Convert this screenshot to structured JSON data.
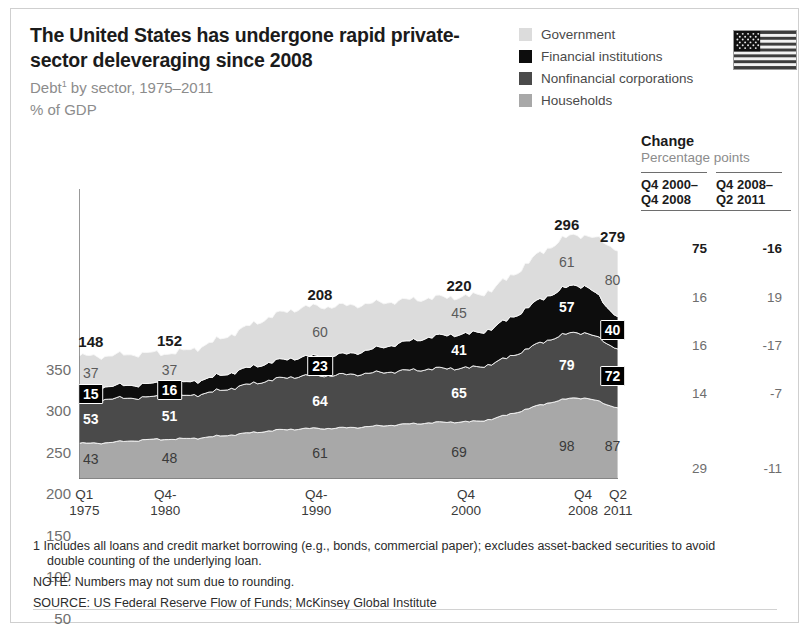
{
  "header": {
    "title": "The United States has undergone rapid private-sector deleveraging since 2008",
    "subtitle_pre": "Debt",
    "subtitle_marker": "1",
    "subtitle_post": " by sector, 1975–2011",
    "units": "% of GDP",
    "flag_icon": "us-flag-icon"
  },
  "legend": {
    "items": [
      {
        "label": "Government",
        "color": "#dcdcdc"
      },
      {
        "label": "Financial institutions",
        "color": "#0d0d0d"
      },
      {
        "label": "Nonfinancial corporations",
        "color": "#4a4a4a"
      },
      {
        "label": "Households",
        "color": "#a8a8a8"
      }
    ]
  },
  "change_table": {
    "title": "Change",
    "subtitle": "Percentage points",
    "columns": [
      "Q4 2000–\nQ4 2008",
      "Q4 2008–\nQ2 2011"
    ],
    "col1_line1": "Q4 2000–",
    "col1_line2": "Q4 2008",
    "col2_line1": "Q4 2008–",
    "col2_line2": "Q2 2011",
    "rows": [
      {
        "name": "Total",
        "c1": "75",
        "c2": "-16",
        "bold": true,
        "y": 232
      },
      {
        "name": "Government",
        "c1": "16",
        "c2": "19",
        "bold": false,
        "y": 281
      },
      {
        "name": "Financial institutions",
        "c1": "16",
        "c2": "-17",
        "bold": false,
        "y": 329
      },
      {
        "name": "Nonfinancial corporations",
        "c1": "14",
        "c2": "-7",
        "bold": false,
        "y": 377
      },
      {
        "name": "Households",
        "c1": "29",
        "c2": "-11",
        "bold": false,
        "y": 452
      }
    ]
  },
  "footnotes": {
    "fn1_line1": "1  Includes all loans and credit market borrowing (e.g., bonds, commercial paper); excludes asset-backed securities to avoid",
    "fn1_line2": "double counting of the underlying loan.",
    "note": "NOTE: Numbers may not sum due to rounding.",
    "source": "SOURCE: US Federal Reserve Flow of Funds; McKinsey Global Institute"
  },
  "chart_data": {
    "type": "area",
    "title": "The United States has undergone rapid private-sector deleveraging since 2008",
    "subtitle": "Debt by sector, 1975–2011",
    "xlabel": "",
    "ylabel": "% of GDP",
    "ylim": [
      0,
      350
    ],
    "yticks": [
      0,
      50,
      100,
      150,
      200,
      250,
      300,
      350
    ],
    "grid": false,
    "legend_position": "top-right",
    "stacked": true,
    "stack_order_bottom_to_top": [
      "Households",
      "Nonfinancial corporations",
      "Financial institutions",
      "Government"
    ],
    "x_tick_labels": [
      {
        "line1": "Q1",
        "line2": "1975",
        "x_frac": 0.01
      },
      {
        "line1": "Q4-",
        "line2": "1980",
        "x_frac": 0.16
      },
      {
        "line1": "Q4-",
        "line2": "1990",
        "x_frac": 0.44
      },
      {
        "line1": "Q4",
        "line2": "2000",
        "x_frac": 0.718
      },
      {
        "line1": "Q4",
        "line2": "2008",
        "x_frac": 0.935
      },
      {
        "line1": "Q2",
        "line2": "2011",
        "x_frac": 1.0
      }
    ],
    "x": [
      "Q1 1975",
      "Q4 1980",
      "Q4 1990",
      "Q4 2000",
      "Q4 2008",
      "Q2 2011"
    ],
    "series": [
      {
        "name": "Households",
        "color": "#a8a8a8",
        "values": [
          43,
          48,
          61,
          69,
          98,
          87
        ]
      },
      {
        "name": "Nonfinancial corporations",
        "color": "#4a4a4a",
        "values": [
          53,
          51,
          64,
          65,
          79,
          72
        ]
      },
      {
        "name": "Financial institutions",
        "color": "#0d0d0d",
        "values": [
          15,
          16,
          23,
          41,
          57,
          40
        ]
      },
      {
        "name": "Government",
        "color": "#dcdcdc",
        "values": [
          37,
          37,
          60,
          45,
          61,
          80
        ]
      }
    ],
    "totals": [
      148,
      152,
      208,
      220,
      296,
      279
    ],
    "quarterly_totals_note": "Data are quarterly from Q1 1975 to Q2 2011",
    "annotations": [
      {
        "text": "148",
        "kind": "total",
        "x_frac": 0.022,
        "value": 148
      },
      {
        "text": "152",
        "kind": "total",
        "x_frac": 0.168,
        "value": 152
      },
      {
        "text": "208",
        "kind": "total",
        "x_frac": 0.447,
        "value": 208
      },
      {
        "text": "220",
        "kind": "total",
        "x_frac": 0.705,
        "value": 220
      },
      {
        "text": "296",
        "kind": "total",
        "x_frac": 0.905,
        "value": 296
      },
      {
        "text": "279",
        "kind": "total",
        "x_frac": 0.99,
        "value": 279
      },
      {
        "text": "37",
        "kind": "onlight",
        "x_frac": 0.022,
        "y_val": 128
      },
      {
        "text": "37",
        "kind": "onlight",
        "x_frac": 0.168,
        "y_val": 131
      },
      {
        "text": "60",
        "kind": "onlight",
        "x_frac": 0.447,
        "y_val": 178
      },
      {
        "text": "45",
        "kind": "onlight",
        "x_frac": 0.705,
        "y_val": 200
      },
      {
        "text": "61",
        "kind": "onlight",
        "x_frac": 0.905,
        "y_val": 262
      },
      {
        "text": "80",
        "kind": "onlight",
        "x_frac": 0.99,
        "y_val": 240
      },
      {
        "text": "15",
        "kind": "onblack",
        "x_frac": 0.022,
        "y_val": 103
      },
      {
        "text": "16",
        "kind": "onblack",
        "x_frac": 0.168,
        "y_val": 107
      },
      {
        "text": "23",
        "kind": "onblack",
        "x_frac": 0.447,
        "y_val": 136
      },
      {
        "text": "41",
        "kind": "ondark",
        "x_frac": 0.705,
        "y_val": 156
      },
      {
        "text": "57",
        "kind": "ondark",
        "x_frac": 0.905,
        "y_val": 208
      },
      {
        "text": "40",
        "kind": "onblack",
        "x_frac": 0.99,
        "y_val": 180
      },
      {
        "text": "53",
        "kind": "ondark",
        "x_frac": 0.022,
        "y_val": 72
      },
      {
        "text": "51",
        "kind": "ondark",
        "x_frac": 0.168,
        "y_val": 76
      },
      {
        "text": "64",
        "kind": "ondark",
        "x_frac": 0.447,
        "y_val": 94
      },
      {
        "text": "65",
        "kind": "ondark",
        "x_frac": 0.705,
        "y_val": 104
      },
      {
        "text": "79",
        "kind": "ondark",
        "x_frac": 0.905,
        "y_val": 138
      },
      {
        "text": "72",
        "kind": "onblack",
        "x_frac": 0.99,
        "y_val": 124
      },
      {
        "text": "43",
        "kind": "onmid",
        "x_frac": 0.022,
        "y_val": 24
      },
      {
        "text": "48",
        "kind": "onmid",
        "x_frac": 0.168,
        "y_val": 25
      },
      {
        "text": "61",
        "kind": "onmid",
        "x_frac": 0.447,
        "y_val": 31
      },
      {
        "text": "69",
        "kind": "onmid",
        "x_frac": 0.705,
        "y_val": 33
      },
      {
        "text": "98",
        "kind": "onmid",
        "x_frac": 0.905,
        "y_val": 40
      },
      {
        "text": "87",
        "kind": "onmid",
        "x_frac": 0.99,
        "y_val": 40
      }
    ]
  }
}
